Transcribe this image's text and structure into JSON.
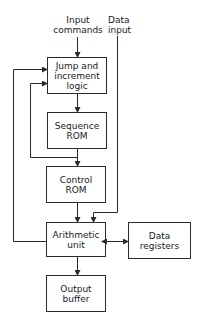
{
  "diagram": {
    "inputs": {
      "commands": "Input\ncommands",
      "data": "Data\ninput"
    },
    "blocks": {
      "jump_logic": "Jump and\nincrement\nlogic",
      "sequence_rom": "Sequence\nROM",
      "control_rom": "Control\nROM",
      "arithmetic_unit": "Arithmetic\nunit",
      "data_registers": "Data\nregisters",
      "output_buffer": "Output\nbuffer"
    },
    "colors": {
      "stroke": "#2a2a2a",
      "background": "#ffffff"
    }
  }
}
